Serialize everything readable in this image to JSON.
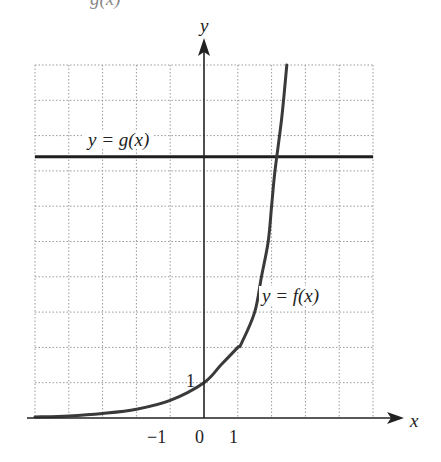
{
  "header_fragment": {
    "text": "g(x)"
  },
  "chart_data": {
    "type": "line",
    "title": "",
    "xlabel": "x",
    "ylabel": "y",
    "xlim": [
      -5,
      5
    ],
    "ylim": [
      0,
      10
    ],
    "grid": true,
    "x_ticks_labeled": [
      "-1",
      "0",
      "1"
    ],
    "y_ticks_labeled": [
      "1"
    ],
    "series": [
      {
        "name": "y = f(x)",
        "kind": "exponential curve",
        "x": [
          -5,
          -4,
          -3,
          -2,
          -1,
          0,
          0.5,
          1,
          1.1,
          1.5,
          1.7,
          1.9,
          2.0,
          2.1,
          2.3,
          2.45
        ],
        "y": [
          0.03,
          0.06,
          0.13,
          0.25,
          0.5,
          1,
          1.5,
          2.0,
          2.1,
          3.0,
          4.0,
          5.0,
          6.0,
          7.0,
          8.5,
          10
        ]
      },
      {
        "name": "y = g(x)",
        "kind": "horizontal line",
        "x": [
          -5,
          5
        ],
        "y": [
          7.4,
          7.4
        ]
      }
    ],
    "annotations": [
      {
        "text": "y = g(x)",
        "x": -3.2,
        "y": 7.8
      },
      {
        "text": "y = f(x)",
        "x": 2.6,
        "y": 3.5
      },
      {
        "text": "1",
        "x": -0.2,
        "y": 1
      }
    ],
    "intersection_approx": {
      "x": 2.1,
      "y": 7.4
    }
  },
  "labels": {
    "y_axis": "y",
    "x_axis": "x",
    "g_label": "y = g(x)",
    "f_label": "y = f(x)",
    "y_tick_1": "1",
    "x_tick_neg1": "−1",
    "x_tick_0": "0",
    "x_tick_1": "1"
  },
  "colors": {
    "axis": "#222222",
    "curve": "#3a3a3a",
    "grid": "#9a9a9a",
    "background": "#ffffff"
  }
}
